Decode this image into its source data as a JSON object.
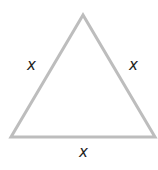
{
  "diagram": {
    "shape": "equilateral-triangle",
    "stroke_color": "#bdbdbd",
    "labels": {
      "left_side": "x",
      "right_side": "x",
      "bottom_side": "x"
    }
  }
}
